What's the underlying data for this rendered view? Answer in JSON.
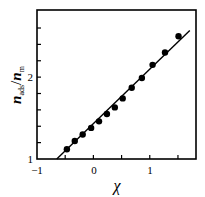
{
  "chart_data": {
    "type": "scatter",
    "title": "",
    "xlabel": "χ",
    "ylabel": "n_ads / n_m",
    "xlim": [
      -1,
      1.82
    ],
    "ylim": [
      1,
      2.82
    ],
    "x_ticks": [
      -1,
      0,
      1
    ],
    "x_minor_ticks": [
      -0.5,
      0.5,
      1.5
    ],
    "y_ticks": [
      1,
      2
    ],
    "y_minor_ticks": [
      1.2,
      1.4,
      1.6,
      1.8,
      2.2,
      2.4,
      2.6
    ],
    "grid": false,
    "series": [
      {
        "name": "data",
        "marker": "filled-circle",
        "x": [
          -0.47,
          -0.33,
          -0.19,
          -0.04,
          0.1,
          0.24,
          0.38,
          0.52,
          0.68,
          0.86,
          1.05,
          1.27,
          1.51
        ],
        "y": [
          1.12,
          1.22,
          1.3,
          1.38,
          1.46,
          1.55,
          1.63,
          1.74,
          1.87,
          1.99,
          2.15,
          2.3,
          2.5
        ]
      },
      {
        "name": "linear fit",
        "style": "line",
        "x": [
          -0.65,
          1.71
        ],
        "y": [
          1.0,
          2.57
        ]
      }
    ]
  },
  "labels": {
    "x_tick_minus1": "−1",
    "x_tick_0": "0",
    "x_tick_1": "1",
    "y_tick_1": "1",
    "y_tick_2": "2",
    "x_title": "χ",
    "y_title_n": "n",
    "y_title_ads": "ads",
    "y_title_slash": "/",
    "y_title_n2": "n",
    "y_title_m": "m"
  }
}
